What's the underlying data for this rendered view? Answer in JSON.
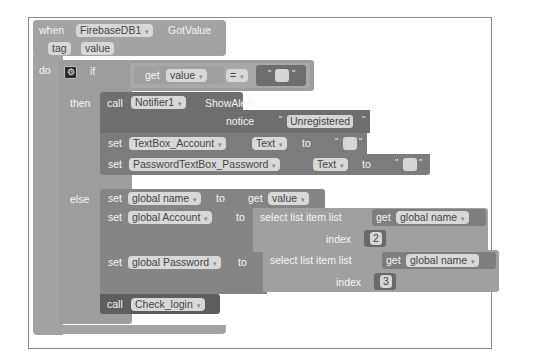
{
  "event": {
    "when": "when",
    "component": "FirebaseDB1",
    "event_name": "GotValue",
    "params": [
      "tag",
      "value"
    ],
    "do": "do"
  },
  "if_block": {
    "if": "if",
    "then": "then",
    "else": "else",
    "condition": {
      "get": "get",
      "var": "value",
      "op": "=",
      "rhs_text": ""
    }
  },
  "then_branch": {
    "alert": {
      "call": "call",
      "component": "Notifier1",
      "method": "ShowAlert",
      "arg_label": "notice",
      "arg_value": "Unregistered"
    },
    "set1": {
      "set": "set",
      "component": "TextBox_Account",
      "prop": "Text",
      "to": "to",
      "value": ""
    },
    "set2": {
      "set": "set",
      "component": "PasswordTextBox_Password",
      "prop": "Text",
      "to": "to",
      "value": ""
    }
  },
  "else_branch": {
    "set_name": {
      "set": "set",
      "var": "global name",
      "to": "to",
      "get": "get",
      "value": "value"
    },
    "set_account": {
      "set": "set",
      "var": "global Account",
      "to": "to",
      "select": "select list item  list",
      "get": "get",
      "list_var": "global name",
      "index_label": "index",
      "index": "2"
    },
    "set_password": {
      "set": "set",
      "var": "global Password",
      "to": "to",
      "select": "select list item  list",
      "get": "get",
      "list_var": "global name",
      "index_label": "index",
      "index": "3"
    },
    "call_proc": {
      "call": "call",
      "procedure": "Check_login"
    }
  },
  "icons": {
    "dropdown": "▾",
    "mutator": "⚙",
    "quote": "\""
  }
}
